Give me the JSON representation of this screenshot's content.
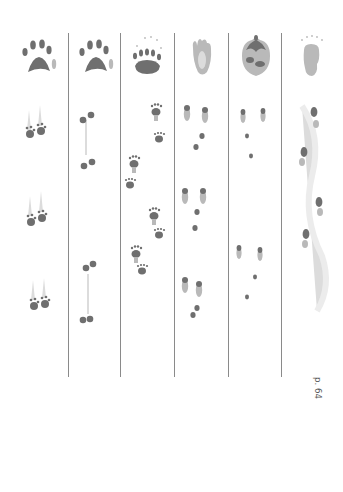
{
  "page": {
    "background": "#ffffff",
    "divider_color": "#8a8a8a",
    "text_color": "#5a5a5a"
  },
  "columns": [
    {
      "id": "long-tailed-weasel",
      "name": "Long-tailed Weasel",
      "page_ref": "p. 54",
      "foot_print_type": "weasel-paw",
      "track_pattern": "paired-bounds",
      "track_groups": [
        {
          "y": 120
        },
        {
          "y": 210
        },
        {
          "y": 300
        }
      ]
    },
    {
      "id": "short-tailed-weasel",
      "name": "Short-tailed Weasel",
      "page_ref": "p. 56",
      "foot_print_type": "weasel-paw",
      "track_pattern": "paired-bounds-offset",
      "track_groups": [
        {
          "y": 116
        },
        {
          "y": 163
        },
        {
          "y": 270
        },
        {
          "y": 322
        }
      ]
    },
    {
      "id": "striped-skunk",
      "name": "Striped Skunk",
      "page_ref": "p. 58",
      "foot_print_type": "skunk-paw",
      "track_pattern": "zigzag-walk",
      "track_groups": [
        {
          "y": 106
        },
        {
          "y": 133
        },
        {
          "y": 158
        },
        {
          "y": 174
        },
        {
          "y": 208
        },
        {
          "y": 228
        },
        {
          "y": 252
        },
        {
          "y": 268
        }
      ]
    },
    {
      "id": "snowshoe-hare",
      "name": "Snowshoe Hare",
      "page_ref": "p. 60",
      "foot_print_type": "hare-hind-foot",
      "track_pattern": "hop-groups",
      "track_groups": [
        {
          "y": 106
        },
        {
          "y": 190
        },
        {
          "y": 280
        }
      ]
    },
    {
      "id": "european-hare",
      "name": "European Hare",
      "page_ref": "p. 62",
      "foot_print_type": "hare-foot-dark",
      "track_pattern": "hop-groups",
      "track_groups": [
        {
          "y": 118
        },
        {
          "y": 245
        }
      ]
    },
    {
      "id": "porcupine",
      "name": "Porcupine",
      "page_ref": "p. 64",
      "foot_print_type": "porcupine-sole",
      "track_pattern": "waddle",
      "track_groups": [
        {
          "y": 120
        },
        {
          "y": 165
        },
        {
          "y": 203
        },
        {
          "y": 235
        }
      ]
    }
  ]
}
